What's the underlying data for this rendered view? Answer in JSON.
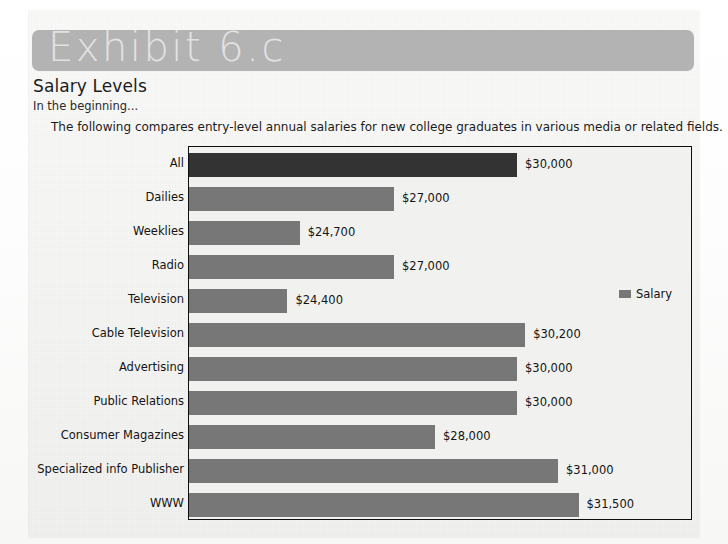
{
  "banner": {
    "label": "Exhibit 6.c"
  },
  "heading": {
    "title": "Salary Levels",
    "subtitle": "In the beginning...",
    "description": "The following compares entry-level annual salaries for new college graduates in various media or related fields."
  },
  "legend": {
    "label": "Salary",
    "swatch_color": "#777777"
  },
  "colors": {
    "bar": "#777777",
    "bar_accent": "#333333",
    "banner": "#b3b3b3",
    "banner_text": "#e2e2e2",
    "frame_border": "#0f0f0f",
    "plot_background": "#f1f1ef",
    "page_background": "#f3f3f1"
  },
  "chart_data": {
    "type": "bar",
    "orientation": "horizontal",
    "title": "Salary Levels",
    "subtitle": "In the beginning...",
    "xlabel": "",
    "ylabel": "",
    "grid": false,
    "legend_position": "right",
    "series": [
      {
        "name": "Salary",
        "values": [
          30000,
          27000,
          24700,
          27000,
          24400,
          30200,
          30000,
          30000,
          28000,
          31000,
          31500
        ]
      }
    ],
    "categories": [
      "All",
      "Dailies",
      "Weeklies",
      "Radio",
      "Television",
      "Cable Television",
      "Advertising",
      "Public Relations",
      "Consumer Magazines",
      "Specialized info Publisher",
      "WWW"
    ],
    "value_labels": [
      "$30,000",
      "$27,000",
      "$24,700",
      "$27,000",
      "$24,400",
      "$30,200",
      "$30,000",
      "$30,000",
      "$28,000",
      "$31,000",
      "$31,500"
    ],
    "xlim": [
      22000,
      32000
    ],
    "highlight_index": 0
  }
}
